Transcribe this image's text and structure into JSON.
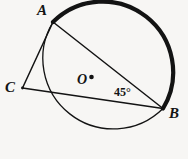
{
  "figure": {
    "kind": "circle-geometry-diagram",
    "background_color": "#f7f6f4",
    "stroke_color": "#131313",
    "labels": {
      "point_a": "A",
      "point_b": "B",
      "point_c": "C",
      "center": "O",
      "angle": "45°"
    },
    "circle": {
      "center_x": 96.5,
      "center_y": 79,
      "radius": 70.5,
      "thin_stroke_width": 1.3,
      "thick_stroke_width": 4.2
    },
    "points": {
      "a": {
        "x": 53.0,
        "y": 22.0
      },
      "b": {
        "x": 163.0,
        "y": 108.5
      },
      "c": {
        "x": 22.5,
        "y": 88.0
      },
      "center_dot": {
        "x": 91.5,
        "y": 77.0,
        "r": 2.3
      }
    },
    "chords": [
      {
        "name": "chord-ab",
        "x1": 53.0,
        "y1": 22.0,
        "x2": 163.0,
        "y2": 108.5
      },
      {
        "name": "chord-ac",
        "x1": 53.0,
        "y1": 22.0,
        "x2": 22.5,
        "y2": 88.0
      },
      {
        "name": "chord-cb",
        "x1": 22.5,
        "y1": 88.0,
        "x2": 163.0,
        "y2": 108.5
      }
    ],
    "highlighted_arc": {
      "name": "arc-a-to-b-major",
      "path": "M 53.0 22.0 A 70.5 70.5 0 0 1 163.0 108.5",
      "sweep": "clockwise-over-top"
    },
    "thin_arc": {
      "name": "arc-a-to-b-minor",
      "path": "M 53.0 22.0 A 70.5 70.5 0 0 0 163.0 108.5"
    }
  }
}
